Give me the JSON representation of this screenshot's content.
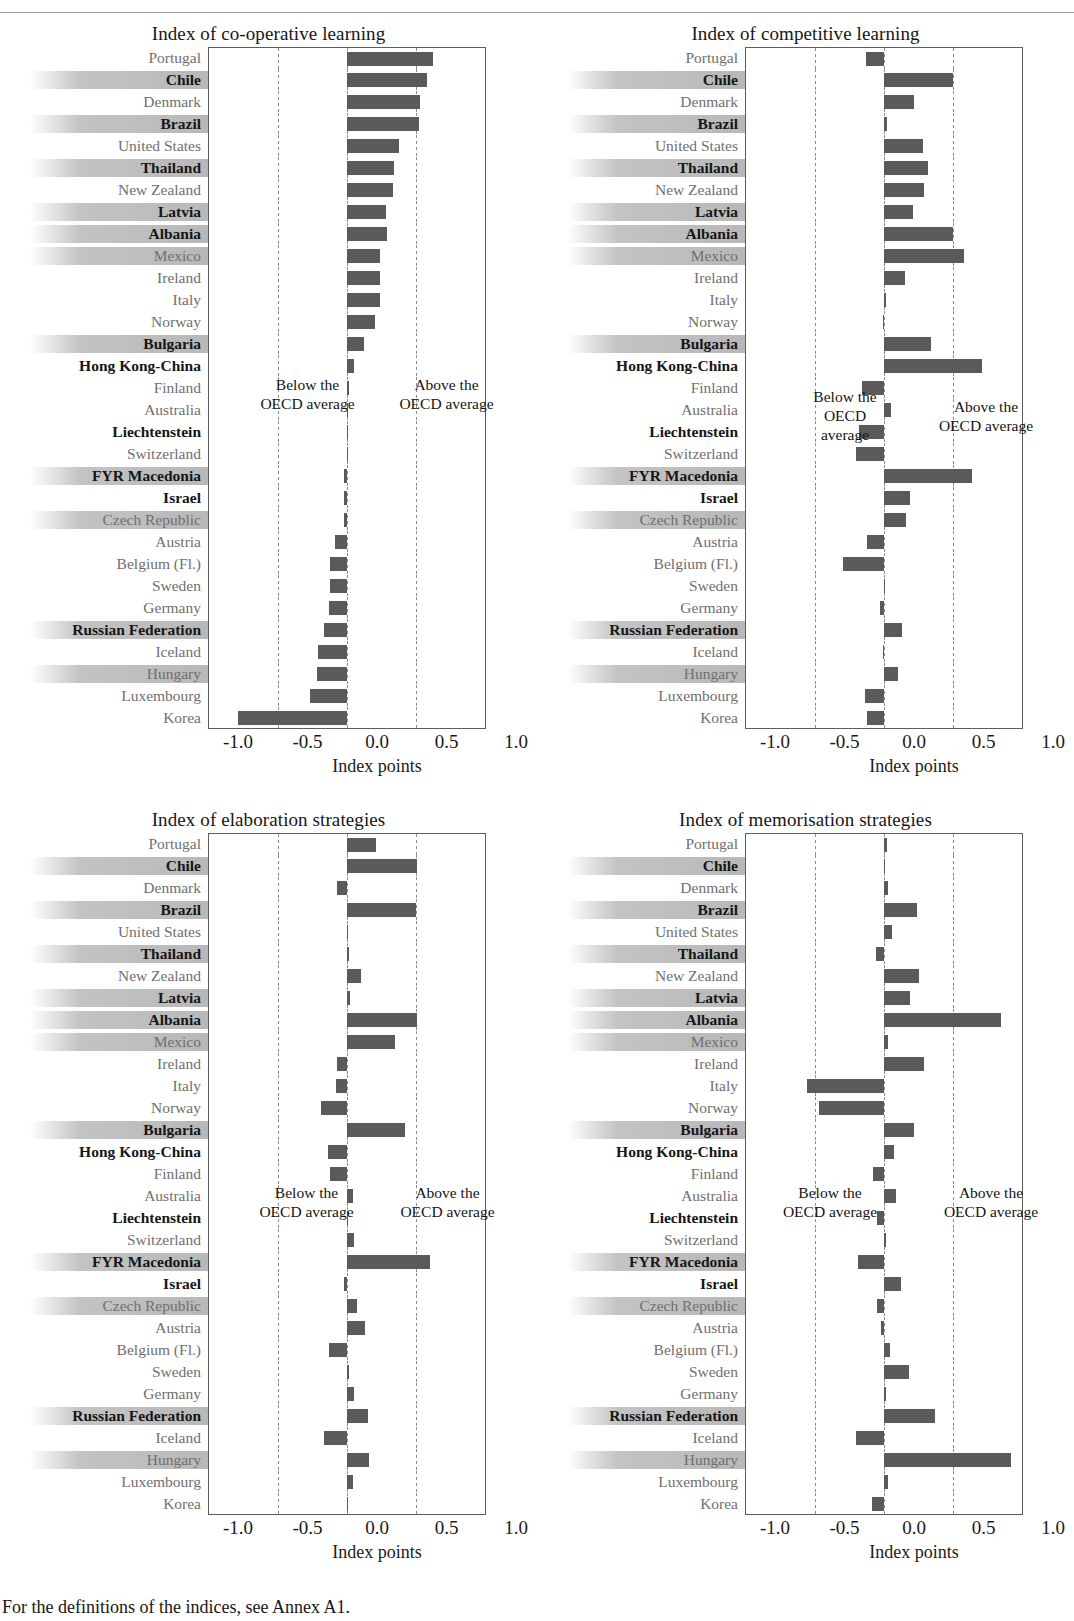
{
  "footnote": "For the definitions of the indices, see Annex A1.",
  "axis": {
    "ticks": [
      "-1.0",
      "-0.5",
      "0.0",
      "0.5",
      "1.0"
    ],
    "tick_values": [
      -1.0,
      -0.5,
      0.0,
      0.5,
      1.0
    ],
    "label": "Index points",
    "below_note": "Below the\nOECD average",
    "above_note": "Above the\nOECD average",
    "below_note_narrow": "Below the\nOECD\naverage",
    "above_note_narrow": "Above the\nOECD average"
  },
  "countries": [
    {
      "name": "Portugal",
      "type": "oecd"
    },
    {
      "name": "Chile",
      "type": "partner"
    },
    {
      "name": "Denmark",
      "type": "oecd"
    },
    {
      "name": "Brazil",
      "type": "partner"
    },
    {
      "name": "United States",
      "type": "oecd"
    },
    {
      "name": "Thailand",
      "type": "partner"
    },
    {
      "name": "New Zealand",
      "type": "oecd"
    },
    {
      "name": "Latvia",
      "type": "partner"
    },
    {
      "name": "Albania",
      "type": "partner"
    },
    {
      "name": "Mexico",
      "type": "oecd"
    },
    {
      "name": "Ireland",
      "type": "oecd"
    },
    {
      "name": "Italy",
      "type": "oecd"
    },
    {
      "name": "Norway",
      "type": "oecd"
    },
    {
      "name": "Bulgaria",
      "type": "partner"
    },
    {
      "name": "Hong Kong-China",
      "type": "partner"
    },
    {
      "name": "Finland",
      "type": "oecd"
    },
    {
      "name": "Australia",
      "type": "oecd"
    },
    {
      "name": "Liechtenstein",
      "type": "partner"
    },
    {
      "name": "Switzerland",
      "type": "oecd"
    },
    {
      "name": "FYR Macedonia",
      "type": "partner"
    },
    {
      "name": "Israel",
      "type": "partner"
    },
    {
      "name": "Czech Republic",
      "type": "oecd"
    },
    {
      "name": "Austria",
      "type": "oecd"
    },
    {
      "name": "Belgium (Fl.)",
      "type": "oecd"
    },
    {
      "name": "Sweden",
      "type": "oecd"
    },
    {
      "name": "Germany",
      "type": "oecd"
    },
    {
      "name": "Russian Federation",
      "type": "partner"
    },
    {
      "name": "Iceland",
      "type": "oecd"
    },
    {
      "name": "Hungary",
      "type": "oecd"
    },
    {
      "name": "Luxembourg",
      "type": "oecd"
    },
    {
      "name": "Korea",
      "type": "oecd"
    }
  ],
  "chart_data": [
    {
      "type": "bar",
      "orientation": "horizontal",
      "title": "Index of co-operative learning",
      "xlabel": "Index points",
      "ylabel": "",
      "xlim": [
        -1.0,
        1.0
      ],
      "grid": true,
      "gridlines": [
        -0.5,
        0.0,
        0.5
      ],
      "legend": "none",
      "categories": [
        "Portugal",
        "Chile",
        "Denmark",
        "Brazil",
        "United States",
        "Thailand",
        "New Zealand",
        "Latvia",
        "Albania",
        "Mexico",
        "Ireland",
        "Italy",
        "Norway",
        "Bulgaria",
        "Hong Kong-China",
        "Finland",
        "Australia",
        "Liechtenstein",
        "Switzerland",
        "FYR Macedonia",
        "Israel",
        "Czech Republic",
        "Austria",
        "Belgium (Fl.)",
        "Sweden",
        "Germany",
        "Russian Federation",
        "Iceland",
        "Hungary",
        "Luxembourg",
        "Korea"
      ],
      "values": [
        0.62,
        0.58,
        0.53,
        0.52,
        0.38,
        0.34,
        0.33,
        0.28,
        0.29,
        0.24,
        0.24,
        0.24,
        0.2,
        0.12,
        0.05,
        0.01,
        0.0,
        0.0,
        0.0,
        -0.02,
        -0.02,
        -0.02,
        -0.09,
        -0.12,
        -0.12,
        -0.13,
        -0.17,
        -0.21,
        -0.22,
        -0.27,
        -0.79
      ]
    },
    {
      "type": "bar",
      "orientation": "horizontal",
      "title": "Index of competitive learning",
      "xlabel": "Index points",
      "ylabel": "",
      "xlim": [
        -1.0,
        1.0
      ],
      "grid": true,
      "gridlines": [
        -0.5,
        0.0,
        0.5
      ],
      "legend": "none",
      "categories": [
        "Portugal",
        "Chile",
        "Denmark",
        "Brazil",
        "United States",
        "Thailand",
        "New Zealand",
        "Latvia",
        "Albania",
        "Mexico",
        "Ireland",
        "Italy",
        "Norway",
        "Bulgaria",
        "Hong Kong-China",
        "Finland",
        "Australia",
        "Liechtenstein",
        "Switzerland",
        "FYR Macedonia",
        "Israel",
        "Czech Republic",
        "Austria",
        "Belgium (Fl.)",
        "Sweden",
        "Germany",
        "Russian Federation",
        "Iceland",
        "Hungary",
        "Luxembourg",
        "Korea"
      ],
      "values": [
        -0.13,
        0.5,
        0.22,
        0.02,
        0.28,
        0.32,
        0.29,
        0.21,
        0.5,
        0.58,
        0.15,
        0.01,
        -0.01,
        0.34,
        0.71,
        -0.16,
        0.05,
        -0.18,
        -0.2,
        0.64,
        0.19,
        0.16,
        -0.12,
        -0.3,
        0.0,
        -0.03,
        0.13,
        -0.01,
        0.1,
        -0.14,
        -0.12
      ]
    },
    {
      "type": "bar",
      "orientation": "horizontal",
      "title": "Index of elaboration strategies",
      "xlabel": "Index points",
      "ylabel": "",
      "xlim": [
        -1.0,
        1.0
      ],
      "grid": true,
      "gridlines": [
        -0.5,
        0.0,
        0.5
      ],
      "legend": "none",
      "categories": [
        "Portugal",
        "Chile",
        "Denmark",
        "Brazil",
        "United States",
        "Thailand",
        "New Zealand",
        "Latvia",
        "Albania",
        "Mexico",
        "Ireland",
        "Italy",
        "Norway",
        "Bulgaria",
        "Hong Kong-China",
        "Finland",
        "Australia",
        "Liechtenstein",
        "Switzerland",
        "FYR Macedonia",
        "Israel",
        "Czech Republic",
        "Austria",
        "Belgium (Fl.)",
        "Sweden",
        "Germany",
        "Russian Federation",
        "Iceland",
        "Hungary",
        "Luxembourg",
        "Korea"
      ],
      "values": [
        0.21,
        0.51,
        -0.07,
        0.5,
        0.0,
        0.01,
        0.1,
        0.02,
        0.51,
        0.35,
        -0.07,
        -0.08,
        -0.19,
        0.42,
        -0.14,
        -0.12,
        0.04,
        0.0,
        0.05,
        0.6,
        -0.02,
        0.07,
        0.13,
        -0.13,
        0.01,
        0.05,
        0.15,
        -0.17,
        0.16,
        0.04,
        0.0
      ]
    },
    {
      "type": "bar",
      "orientation": "horizontal",
      "title": "Index of memorisation strategies",
      "xlabel": "Index points",
      "ylabel": "",
      "xlim": [
        -1.0,
        1.0
      ],
      "grid": true,
      "gridlines": [
        -0.5,
        0.0,
        0.5
      ],
      "legend": "none",
      "categories": [
        "Portugal",
        "Chile",
        "Denmark",
        "Brazil",
        "United States",
        "Thailand",
        "New Zealand",
        "Latvia",
        "Albania",
        "Mexico",
        "Ireland",
        "Italy",
        "Norway",
        "Bulgaria",
        "Hong Kong-China",
        "Finland",
        "Australia",
        "Liechtenstein",
        "Switzerland",
        "FYR Macedonia",
        "Israel",
        "Czech Republic",
        "Austria",
        "Belgium (Fl.)",
        "Sweden",
        "Germany",
        "Russian Federation",
        "Iceland",
        "Hungary",
        "Luxembourg",
        "Korea"
      ],
      "values": [
        0.02,
        0.0,
        0.03,
        0.24,
        0.06,
        -0.06,
        0.25,
        0.19,
        0.85,
        0.03,
        0.29,
        -0.56,
        -0.47,
        0.22,
        0.07,
        -0.08,
        0.09,
        -0.05,
        0.01,
        -0.19,
        0.12,
        -0.05,
        -0.02,
        0.04,
        0.18,
        0.01,
        0.37,
        -0.2,
        0.92,
        0.03,
        -0.09
      ]
    }
  ]
}
